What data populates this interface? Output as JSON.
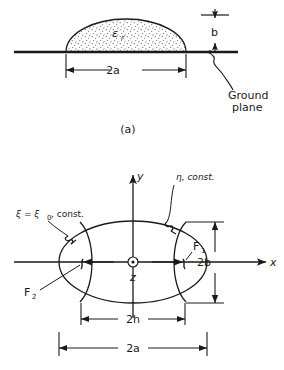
{
  "figure": {
    "caption_a": "(a)",
    "panel_a": {
      "name": "dielectric-half-ellipse-on-ground-plane",
      "dielectric_label": "ε",
      "dielectric_sub": "r",
      "height_label": "b",
      "width_label": "2a",
      "ground_label_line1": "Ground",
      "ground_label_line2": "plane"
    },
    "panel_b": {
      "name": "elliptic-cylindrical-coordinates",
      "axis_x": "x",
      "axis_y": "y",
      "axis_z": "z",
      "xi_label": "ξ = ξ",
      "xi_sub": "0",
      "xi_tail": ", const.",
      "eta_label": "η, const.",
      "focus_1": "F",
      "focus_1_sub": "1",
      "focus_2": "F",
      "focus_2_sub": "2",
      "height_label": "2b",
      "focal_label": "2h",
      "width_label": "2a"
    }
  },
  "colors": {
    "ink": "#1a1a1a",
    "background": "#ffffff",
    "stipple": "#555555"
  }
}
